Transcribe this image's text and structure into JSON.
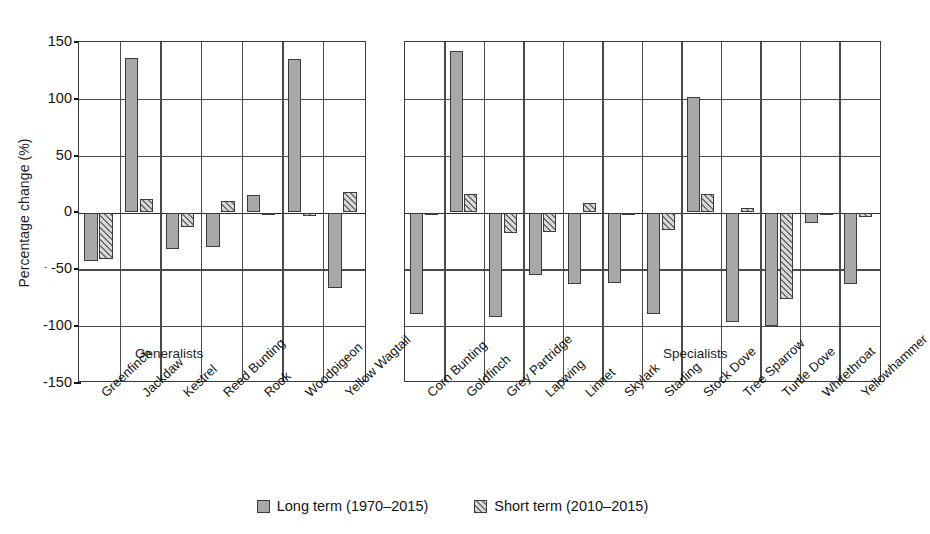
{
  "chart_data": {
    "type": "bar",
    "title": "",
    "xlabel": "",
    "ylabel": "Percentage change (%)",
    "ylim": [
      -150,
      150
    ],
    "yticks": [
      150,
      100,
      50,
      0,
      -50,
      -100,
      -150
    ],
    "grid": true,
    "legend_position": "bottom",
    "series": [
      {
        "name": "Long term (1970–2015)",
        "key": "long_term",
        "fill": "solid-grey"
      },
      {
        "name": "Short term (2010–2015)",
        "key": "short_term",
        "fill": "hatched-diagonal"
      }
    ],
    "panels": [
      {
        "tag": "Generalists",
        "categories": [
          "Greenfinch",
          "Jackdaw",
          "Kestrel",
          "Reed Bunting",
          "Rook",
          "Woodpigeon",
          "Yellow Wagtail"
        ],
        "long_term": [
          -43,
          136,
          -32,
          -30,
          15,
          135,
          -66
        ],
        "short_term": [
          -41,
          12,
          -13,
          10,
          -2,
          -3,
          18
        ]
      },
      {
        "tag": "Specialists",
        "categories": [
          "Corn Bunting",
          "Goldfinch",
          "Grey Partridge",
          "Lapwing",
          "Linnet",
          "Skylark",
          "Starling",
          "Stock Dove",
          "Tree Sparrow",
          "Turtle Dove",
          "Whitethroat",
          "Yellowhammer"
        ],
        "long_term": [
          -89,
          142,
          -92,
          -55,
          -63,
          -62,
          -89,
          102,
          -96,
          -100,
          -9,
          -63
        ],
        "short_term": [
          -2,
          16,
          -18,
          -17,
          8,
          -2,
          -15,
          16,
          4,
          -76,
          -1,
          -4
        ]
      }
    ]
  },
  "axis": {
    "ylabel": "Percentage change (%)",
    "tick_150": "150",
    "tick_100": "100",
    "tick_50": "50",
    "tick_0": "0",
    "tick_neg50": "-50",
    "tick_neg100": "-100",
    "tick_neg150": "-150",
    "minor_mark": "-"
  },
  "panels": {
    "generalists_tag": "Generalists",
    "specialists_tag": "Specialists"
  },
  "legend": {
    "long_term_label": "Long term (1970–2015)",
    "short_term_label": "Short term (2010–2015)"
  },
  "colors": {
    "long_term_fill": "#a8a8a8",
    "short_term_fill": "#d8d8d8",
    "hatch_stroke": "#6f6f6f",
    "bar_border": "#3c3c3c",
    "grid": "#4a4a4a",
    "axis": "#3a3a3a",
    "text": "#141414",
    "background": "#ffffff"
  }
}
